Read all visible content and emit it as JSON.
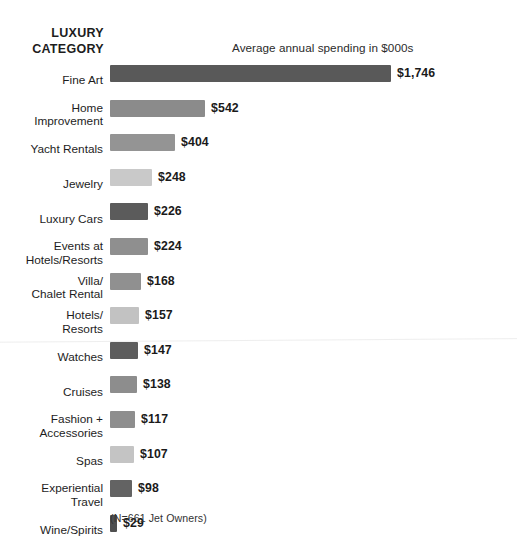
{
  "header": {
    "category_heading_line1": "LUXURY",
    "category_heading_line2": "CATEGORY",
    "value_heading": "Average annual spending in $000s"
  },
  "footnote": "(N=661 Jet Owners)",
  "chart_data": {
    "type": "bar",
    "orientation": "horizontal",
    "title": "",
    "xlabel": "Average annual spending in $000s",
    "ylabel": "LUXURY CATEGORY",
    "grid": false,
    "legend": "none",
    "axis_visible": false,
    "xlim": [
      0,
      1746
    ],
    "note": "(N=661 Jet Owners)",
    "categories": [
      "Fine Art",
      "Home Improvement",
      "Yacht Rentals",
      "Jewelry",
      "Luxury Cars",
      "Events at Hotels/Resorts",
      "Villa/ Chalet Rental",
      "Hotels/ Resorts",
      "Watches",
      "Cruises",
      "Fashion + Accessories",
      "Spas",
      "Experiential Travel",
      "Wine/Spirits"
    ],
    "values": [
      1746,
      542,
      404,
      248,
      226,
      224,
      168,
      157,
      147,
      138,
      117,
      107,
      98,
      29
    ],
    "value_labels": [
      "$1,746",
      "$542",
      "$404",
      "$248",
      "$226",
      "$224",
      "$168",
      "$157",
      "$147",
      "$138",
      "$117",
      "$107",
      "$98",
      "$29"
    ],
    "bar_colors": [
      "#595959",
      "#8b8b8b",
      "#949494",
      "#c9c9c9",
      "#5b5b5b",
      "#8f8f8f",
      "#909090",
      "#c2c2c2",
      "#5d5d5d",
      "#8d8d8d",
      "#8e8e8e",
      "#c4c4c4",
      "#636363",
      "#4f4f4f"
    ]
  },
  "rows": [
    {
      "label": "Fine Art",
      "label_lines": "Fine Art",
      "value": "$1,746",
      "bar_width_px": 281,
      "color": "#595959"
    },
    {
      "label": "Home Improvement",
      "label_lines": "Home\nImprovement",
      "value": "$542",
      "bar_width_px": 95,
      "color": "#8b8b8b"
    },
    {
      "label": "Yacht Rentals",
      "label_lines": "Yacht Rentals",
      "value": "$404",
      "bar_width_px": 65,
      "color": "#949494"
    },
    {
      "label": "Jewelry",
      "label_lines": "Jewelry",
      "value": "$248",
      "bar_width_px": 42,
      "color": "#c9c9c9"
    },
    {
      "label": "Luxury Cars",
      "label_lines": "Luxury Cars",
      "value": "$226",
      "bar_width_px": 38,
      "color": "#5b5b5b"
    },
    {
      "label": "Events at Hotels/Resorts",
      "label_lines": "Events at\nHotels/Resorts",
      "value": "$224",
      "bar_width_px": 38,
      "color": "#8f8f8f"
    },
    {
      "label": "Villa/ Chalet Rental",
      "label_lines": "Villa/\nChalet Rental",
      "value": "$168",
      "bar_width_px": 31,
      "color": "#909090"
    },
    {
      "label": "Hotels/ Resorts",
      "label_lines": "Hotels/\nResorts",
      "value": "$157",
      "bar_width_px": 29,
      "color": "#c2c2c2"
    },
    {
      "label": "Watches",
      "label_lines": "Watches",
      "value": "$147",
      "bar_width_px": 28,
      "color": "#5d5d5d"
    },
    {
      "label": "Cruises",
      "label_lines": "Cruises",
      "value": "$138",
      "bar_width_px": 27,
      "color": "#8d8d8d"
    },
    {
      "label": "Fashion + Accessories",
      "label_lines": "Fashion +\nAccessories",
      "value": "$117",
      "bar_width_px": 25,
      "color": "#8e8e8e"
    },
    {
      "label": "Spas",
      "label_lines": "Spas",
      "value": "$107",
      "bar_width_px": 24,
      "color": "#c4c4c4"
    },
    {
      "label": "Experiential Travel",
      "label_lines": "Experiential\nTravel",
      "value": "$98",
      "bar_width_px": 22,
      "color": "#636363"
    },
    {
      "label": "Wine/Spirits",
      "label_lines": "Wine/Spirits",
      "value": "$29",
      "bar_width_px": 7,
      "color": "#4f4f4f"
    }
  ]
}
